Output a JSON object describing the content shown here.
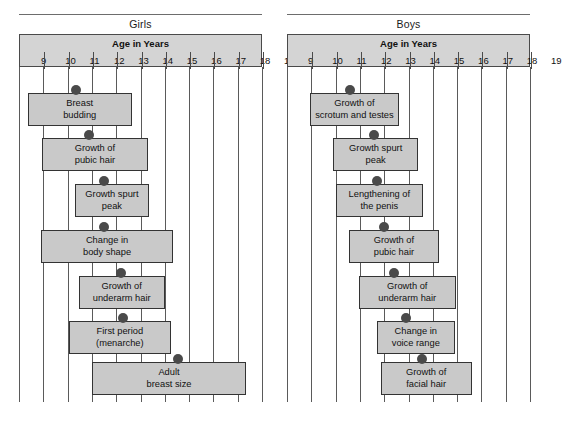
{
  "figure": {
    "axis_title": "Age in Years",
    "tick_labels": [
      "9",
      "10",
      "11",
      "12",
      "13",
      "14",
      "15",
      "16",
      "17",
      "18",
      "19"
    ],
    "age_min": 9,
    "age_max": 19,
    "colors": {
      "bar_fill": "#c9c9c9",
      "bar_border": "#333333",
      "header_fill": "#d4d4d4",
      "header_border": "#4a4a4a",
      "gridline": "#5a5a5a",
      "dot": "#4a4a4a",
      "background": "#ffffff"
    }
  },
  "chart_data": {
    "type": "bar",
    "xlabel": "Age in Years",
    "ylabel": "",
    "xlim": [
      9,
      19
    ],
    "grid": true,
    "legend": "none",
    "orientation": "horizontal",
    "panels": [
      {
        "name": "Girls",
        "label": "Girls",
        "events": [
          {
            "label": "Breast budding",
            "line1": "Breast",
            "line2": "budding",
            "start": 9.35,
            "end": 13.65,
            "marker": 11.35
          },
          {
            "label": "Growth of pubic hair",
            "line1": "Growth of",
            "line2": "pubic hair",
            "start": 9.95,
            "end": 14.3,
            "marker": 11.9
          },
          {
            "label": "Growth spurt peak",
            "line1": "Growth spurt",
            "line2": "peak",
            "start": 11.3,
            "end": 14.35,
            "marker": 12.5
          },
          {
            "label": "Change in body shape",
            "line1": "Change in",
            "line2": "body shape",
            "start": 9.9,
            "end": 15.35,
            "marker": 12.5
          },
          {
            "label": "Growth of underarm hair",
            "line1": "Growth of",
            "line2": "underarm hair",
            "start": 11.45,
            "end": 15.0,
            "marker": 13.2
          },
          {
            "label": "First period (menarche)",
            "line1": "First period",
            "line2": "(menarche)",
            "start": 11.05,
            "end": 15.25,
            "marker": 13.3
          },
          {
            "label": "Adult breast size",
            "line1": "Adult",
            "line2": "breast size",
            "start": 12.0,
            "end": 18.35,
            "marker": 15.55
          }
        ]
      },
      {
        "name": "Boys",
        "label": "Boys",
        "events": [
          {
            "label": "Growth of scrotum and testes",
            "line1": "Growth of",
            "line2": "scrotum and testes",
            "start": 9.95,
            "end": 13.6,
            "marker": 11.6
          },
          {
            "label": "Growth spurt peak",
            "line1": "Growth spurt",
            "line2": "peak",
            "start": 10.9,
            "end": 14.4,
            "marker": 12.6
          },
          {
            "label": "Lengthening of the penis",
            "line1": "Lengthening of",
            "line2": "the penis",
            "start": 11.0,
            "end": 14.6,
            "marker": 12.7
          },
          {
            "label": "Growth of pubic hair",
            "line1": "Growth of",
            "line2": "pubic hair",
            "start": 11.55,
            "end": 15.25,
            "marker": 13.0
          },
          {
            "label": "Growth of underarm hair",
            "line1": "Growth of",
            "line2": "underarm hair",
            "start": 11.95,
            "end": 15.95,
            "marker": 13.4
          },
          {
            "label": "Change in voice range",
            "line1": "Change in",
            "line2": "voice range",
            "start": 12.7,
            "end": 15.9,
            "marker": 13.9
          },
          {
            "label": "Growth of facial hair",
            "line1": "Growth of",
            "line2": "facial hair",
            "start": 12.85,
            "end": 16.6,
            "marker": 14.55
          }
        ]
      }
    ]
  }
}
